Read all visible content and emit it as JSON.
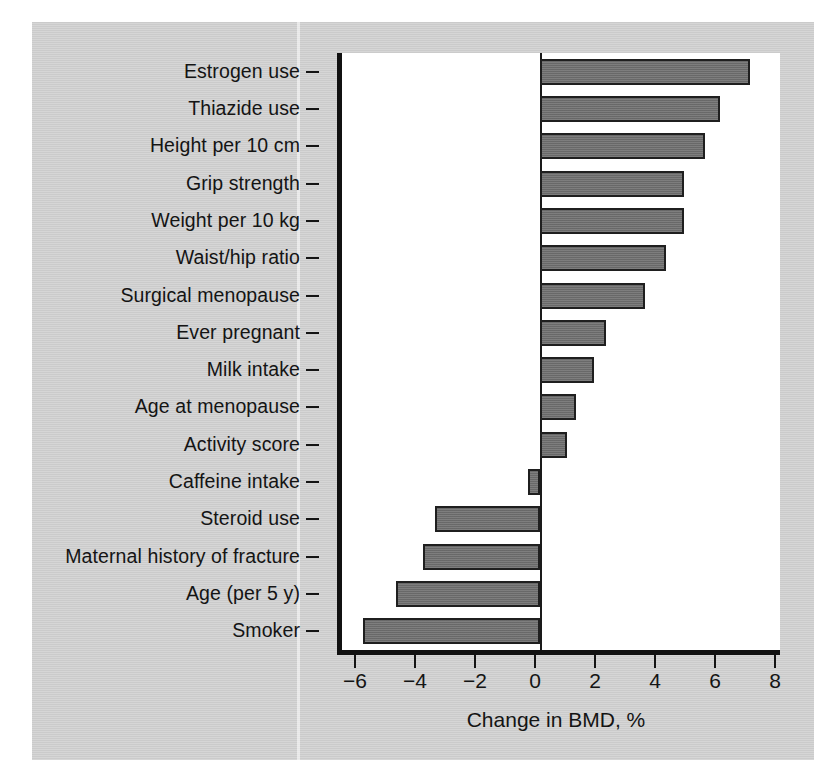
{
  "figure": {
    "background_color": "#cbcbcb",
    "plot_background_color": "#ffffff",
    "bar_fill_color": "#6f6f6f",
    "bar_edge_color": "#1f1f1f",
    "axis_color": "#111111"
  },
  "chart_data": {
    "type": "bar",
    "orientation": "horizontal",
    "title": "",
    "xlabel": "Change in BMD, %",
    "ylabel": "",
    "xlim": [
      -6.6,
      8.0
    ],
    "xticks": [
      -6,
      -4,
      -2,
      0,
      2,
      4,
      6,
      8
    ],
    "xticklabels": [
      "−6",
      "−4",
      "−2",
      "0",
      "2",
      "4",
      "6",
      "8"
    ],
    "grid": false,
    "legend": null,
    "zero_reference_line": 0,
    "categories": [
      "Estrogen use",
      "Thiazide use",
      "Height per 10 cm",
      "Grip strength",
      "Weight per 10 kg",
      "Waist/hip ratio",
      "Surgical menopause",
      "Ever pregnant",
      "Milk intake",
      "Age at menopause",
      "Activity score",
      "Caffeine intake",
      "Steroid use",
      "Maternal history of fracture",
      "Age (per 5 y)",
      "Smoker"
    ],
    "values": [
      7.0,
      6.0,
      5.5,
      4.8,
      4.8,
      4.2,
      3.5,
      2.2,
      1.8,
      1.2,
      0.9,
      -0.4,
      -3.5,
      -3.9,
      -4.8,
      -5.9
    ]
  }
}
